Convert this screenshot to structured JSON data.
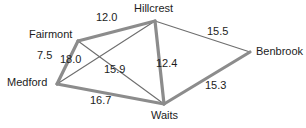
{
  "diagram": {
    "kind": "weighted-graph",
    "background_color": "#ffffff",
    "edge_color_thick": "#8c8c8c",
    "edge_color_thin": "#6e6e6e",
    "text_color": "#1c1c1c"
  },
  "nodes": [
    {
      "id": "hillcrest",
      "label": "Hillcrest",
      "x": 155,
      "y": 21,
      "label_x": 134,
      "label_y": 3,
      "label_align": "center"
    },
    {
      "id": "fairmont",
      "label": "Fairmont",
      "x": 78,
      "y": 41,
      "label_x": 29,
      "label_y": 29,
      "label_align": "right"
    },
    {
      "id": "benbrook",
      "label": "Benbrook",
      "x": 250,
      "y": 52,
      "label_x": 256,
      "label_y": 46,
      "label_align": "left"
    },
    {
      "id": "medford",
      "label": "Medford",
      "x": 57,
      "y": 84,
      "label_x": 7,
      "label_y": 77,
      "label_align": "right"
    },
    {
      "id": "waits",
      "label": "Waits",
      "x": 164,
      "y": 104,
      "label_x": 151,
      "label_y": 110,
      "label_align": "center"
    }
  ],
  "edges": [
    {
      "id": "fairmont-hillcrest",
      "from": "fairmont",
      "to": "hillcrest",
      "weight": "12.0",
      "weight_x": 96,
      "weight_y": 12,
      "style": "thick",
      "width": 3.2
    },
    {
      "id": "fairmont-medford",
      "from": "fairmont",
      "to": "medford",
      "weight": "7.5",
      "weight_x": 37,
      "weight_y": 50,
      "style": "thick",
      "width": 3.2
    },
    {
      "id": "hillcrest-waits",
      "from": "hillcrest",
      "to": "waits",
      "weight": "12.4",
      "weight_x": 156,
      "weight_y": 58,
      "style": "thick",
      "width": 3.2
    },
    {
      "id": "waits-benbrook",
      "from": "waits",
      "to": "benbrook",
      "weight": "15.3",
      "weight_x": 205,
      "weight_y": 80,
      "style": "thick",
      "width": 3.2
    },
    {
      "id": "medford-waits",
      "from": "medford",
      "to": "waits",
      "weight": "16.7",
      "weight_x": 90,
      "weight_y": 95,
      "style": "thick",
      "width": 3.2
    },
    {
      "id": "medford-hillcrest",
      "from": "medford",
      "to": "hillcrest",
      "weight": "18.0",
      "weight_x": 60,
      "weight_y": 54,
      "style": "thin",
      "width": 1.1
    },
    {
      "id": "fairmont-waits",
      "from": "fairmont",
      "to": "waits",
      "weight": "15.9",
      "weight_x": 104,
      "weight_y": 64,
      "style": "thin",
      "width": 1.1
    },
    {
      "id": "hillcrest-benbrook",
      "from": "hillcrest",
      "to": "benbrook",
      "weight": "15.5",
      "weight_x": 207,
      "weight_y": 26,
      "style": "thin",
      "width": 1.1
    }
  ]
}
